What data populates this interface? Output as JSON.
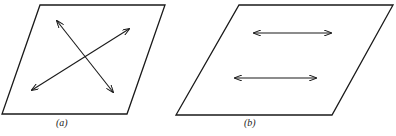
{
  "figure": {
    "panels": [
      {
        "id": "a",
        "label": "(a)",
        "description": "parallelogram plane with two crossing double-headed arrows"
      },
      {
        "id": "b",
        "label": "(b)",
        "description": "parallelogram plane with two parallel horizontal double-headed arrows"
      }
    ],
    "stroke_color": "#1a1a1a"
  }
}
